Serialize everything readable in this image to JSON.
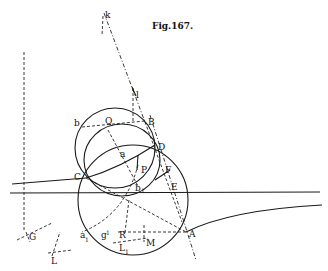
{
  "figure": {
    "title": "Fig.167.",
    "labels": {
      "k": "k",
      "l": "l",
      "B": "B",
      "b": "b",
      "Q": "Q",
      "D": "D",
      "a": "a",
      "C": "C",
      "P": "P",
      "F": "F",
      "b1": "b",
      "b1_sub": "1",
      "E": "E",
      "A": "A",
      "G": "G",
      "a1": "a",
      "a1_sub": "1",
      "g": "g",
      "g_sub": "1",
      "R": "R",
      "M": "M",
      "L1": "L",
      "L1_sub": "1",
      "L": "L"
    }
  }
}
